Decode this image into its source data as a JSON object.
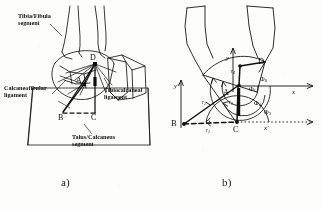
{
  "figure": {
    "caption_a": "a)",
    "caption_b": "b)"
  },
  "panel_a": {
    "name": "anatomical-ankle-ligament-sketch",
    "labels": {
      "tibia_fibula": "Tibia/Fibula\nsegment",
      "calcaneofibular": "Calcaneofibular\nligament",
      "tibiocalcaneal": "Tibiocalcaneal\nligament",
      "talus_calcaneus": "Talus/Calcaneus\nsegment"
    },
    "points": {
      "a": "A",
      "b": "B",
      "c": "C",
      "d": "D"
    }
  },
  "panel_b": {
    "name": "four-bar-linkage-kinematic-diagram",
    "points": {
      "a": "A",
      "b": "B",
      "c": "C",
      "d": "D"
    },
    "axes": [
      {
        "label": "y",
        "name": "y-axis"
      },
      {
        "label": "x",
        "name": "x-axis"
      },
      {
        "label": "y'",
        "name": "y-prime-axis"
      },
      {
        "label": "x'",
        "name": "x-prime-axis"
      }
    ],
    "radii": [
      {
        "label": "r",
        "sub": "1",
        "name": "link-length-r1"
      },
      {
        "label": "r",
        "sub": "2",
        "name": "link-length-r2"
      },
      {
        "label": "r",
        "sub": "3",
        "name": "link-length-r3"
      },
      {
        "label": "r",
        "sub": "4",
        "name": "link-length-r4"
      }
    ],
    "angles": [
      {
        "label": "Φ",
        "sub": "0",
        "name": "angle-phi-0"
      },
      {
        "label": "Φ",
        "sub": "1",
        "name": "angle-phi-1"
      },
      {
        "label": "Φ",
        "sub": "4",
        "name": "angle-phi-4"
      },
      {
        "label": "Φ",
        "sub": "3",
        "name": "angle-phi-3"
      }
    ]
  },
  "colors": {
    "ink": "#141414",
    "paper": "#fdfdfc"
  }
}
